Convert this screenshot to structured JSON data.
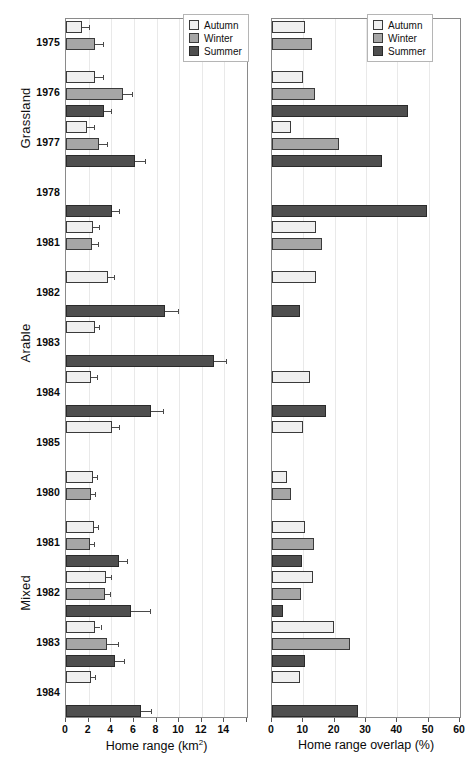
{
  "figure": {
    "title": "",
    "groups": [
      {
        "name": "Grassland",
        "label": "Grassland"
      },
      {
        "name": "Arable",
        "label": "Arable"
      },
      {
        "name": "Mixed",
        "label": "Mixed"
      }
    ],
    "seasons": [
      {
        "key": "autumn",
        "label": "Autumn",
        "color": "#efefef"
      },
      {
        "key": "winter",
        "label": "Winter",
        "color": "#a6a6a6"
      },
      {
        "key": "summer",
        "label": "Summer",
        "color": "#4f4f4f"
      }
    ],
    "legend": {
      "position": "top-right",
      "entries": [
        "Autumn",
        "Winter",
        "Summer"
      ]
    },
    "years": [
      "1975",
      "1976",
      "1977",
      "1978",
      "1981",
      "1982",
      "1983",
      "1984",
      "1985",
      "1980",
      "1981",
      "1982",
      "1983",
      "1984"
    ]
  },
  "chart_data": [
    {
      "type": "bar",
      "panel": "left",
      "title": "",
      "xlabel": "Home range (km2)",
      "xlabel_html": "Home range (km<sup>2</sup>)",
      "ylabel": "",
      "orientation": "horizontal",
      "xlim": [
        0,
        16
      ],
      "xticks": [
        0,
        2,
        4,
        6,
        8,
        10,
        12,
        14,
        16
      ],
      "xticklabels": [
        "0",
        "2",
        "4",
        "6",
        "8",
        "10",
        "12",
        "14",
        ""
      ],
      "grid": "vertical",
      "legend": [
        "Autumn",
        "Winter",
        "Summer"
      ],
      "error_bars": true,
      "groups": [
        {
          "habitat": "Grassland",
          "rows": [
            {
              "year": "1975",
              "bars": [
                {
                  "season": "Autumn",
                  "value": 1.45,
                  "err": 0.55
                },
                {
                  "season": "Winter",
                  "value": 2.55,
                  "err": 0.75
                }
              ]
            },
            {
              "year": "1976",
              "bars": [
                {
                  "season": "Autumn",
                  "value": 2.55,
                  "err": 0.7
                },
                {
                  "season": "Winter",
                  "value": 5.05,
                  "err": 0.8
                },
                {
                  "season": "Summer",
                  "value": 3.4,
                  "err": 0.55
                }
              ]
            },
            {
              "year": "1977",
              "bars": [
                {
                  "season": "Autumn",
                  "value": 1.9,
                  "err": 0.6
                },
                {
                  "season": "Winter",
                  "value": 2.95,
                  "err": 0.7
                },
                {
                  "season": "Summer",
                  "value": 6.1,
                  "err": 0.9
                }
              ]
            },
            {
              "year": "1978",
              "bars": [
                {
                  "season": "Summer",
                  "value": 4.1,
                  "err": 0.6
                }
              ]
            }
          ]
        },
        {
          "habitat": "Arable",
          "rows": [
            {
              "year": "1981",
              "bars": [
                {
                  "season": "Autumn",
                  "value": 2.4,
                  "err": 0.55
                },
                {
                  "season": "Winter",
                  "value": 2.3,
                  "err": 0.55
                }
              ]
            },
            {
              "year": "1982",
              "bars": [
                {
                  "season": "Autumn",
                  "value": 3.7,
                  "err": 0.55
                },
                {
                  "season": "Summer",
                  "value": 8.75,
                  "err": 1.15
                }
              ]
            },
            {
              "year": "1983",
              "bars": [
                {
                  "season": "Autumn",
                  "value": 2.6,
                  "err": 0.35
                },
                {
                  "season": "Summer",
                  "value": 13.1,
                  "err": 1.05
                }
              ]
            },
            {
              "year": "1984",
              "bars": [
                {
                  "season": "Autumn",
                  "value": 2.25,
                  "err": 0.45
                },
                {
                  "season": "Summer",
                  "value": 7.55,
                  "err": 1.05
                }
              ]
            },
            {
              "year": "1985",
              "bars": [
                {
                  "season": "Autumn",
                  "value": 4.1,
                  "err": 0.55
                }
              ]
            }
          ]
        },
        {
          "habitat": "Mixed",
          "rows": [
            {
              "year": "1980",
              "bars": [
                {
                  "season": "Autumn",
                  "value": 2.4,
                  "err": 0.35
                },
                {
                  "season": "Winter",
                  "value": 2.2,
                  "err": 0.4
                }
              ]
            },
            {
              "year": "1981",
              "bars": [
                {
                  "season": "Autumn",
                  "value": 2.45,
                  "err": 0.4
                },
                {
                  "season": "Winter",
                  "value": 2.15,
                  "err": 0.35
                },
                {
                  "season": "Summer",
                  "value": 4.7,
                  "err": 0.7
                }
              ]
            },
            {
              "year": "1982",
              "bars": [
                {
                  "season": "Autumn",
                  "value": 3.55,
                  "err": 0.45
                },
                {
                  "season": "Winter",
                  "value": 3.45,
                  "err": 0.45
                },
                {
                  "season": "Summer",
                  "value": 5.75,
                  "err": 1.7
                }
              ]
            },
            {
              "year": "1983",
              "bars": [
                {
                  "season": "Autumn",
                  "value": 2.6,
                  "err": 0.45
                },
                {
                  "season": "Winter",
                  "value": 3.6,
                  "err": 1.0
                },
                {
                  "season": "Summer",
                  "value": 4.35,
                  "err": 0.8
                }
              ]
            },
            {
              "year": "1984",
              "bars": [
                {
                  "season": "Autumn",
                  "value": 2.2,
                  "err": 0.4
                },
                {
                  "season": "Summer",
                  "value": 6.6,
                  "err": 0.9
                }
              ]
            }
          ]
        }
      ]
    },
    {
      "type": "bar",
      "panel": "right",
      "title": "",
      "xlabel": "Home range overlap (%)",
      "xlabel_html": "Home range overlap (%)",
      "ylabel": "",
      "orientation": "horizontal",
      "xlim": [
        0,
        60
      ],
      "xticks": [
        0,
        10,
        20,
        30,
        40,
        50,
        60
      ],
      "xticklabels": [
        "0",
        "10",
        "20",
        "30",
        "40",
        "50",
        "60"
      ],
      "grid": "vertical",
      "legend": [
        "Autumn",
        "Winter",
        "Summer"
      ],
      "error_bars": false,
      "groups": [
        {
          "habitat": "Grassland",
          "rows": [
            {
              "year": "1975",
              "bars": [
                {
                  "season": "Autumn",
                  "value": 10.5
                },
                {
                  "season": "Winter",
                  "value": 12.8
                }
              ]
            },
            {
              "year": "1976",
              "bars": [
                {
                  "season": "Autumn",
                  "value": 9.8
                },
                {
                  "season": "Winter",
                  "value": 13.6
                },
                {
                  "season": "Summer",
                  "value": 43.5
                }
              ]
            },
            {
              "year": "1977",
              "bars": [
                {
                  "season": "Autumn",
                  "value": 6.0
                },
                {
                  "season": "Winter",
                  "value": 21.5
                },
                {
                  "season": "Summer",
                  "value": 35.0
                }
              ]
            },
            {
              "year": "1978",
              "bars": [
                {
                  "season": "Summer",
                  "value": 49.5
                }
              ]
            }
          ]
        },
        {
          "habitat": "Arable",
          "rows": [
            {
              "year": "1981",
              "bars": [
                {
                  "season": "Autumn",
                  "value": 14.2
                },
                {
                  "season": "Winter",
                  "value": 15.8
                }
              ]
            },
            {
              "year": "1982",
              "bars": [
                {
                  "season": "Autumn",
                  "value": 14.0
                },
                {
                  "season": "Summer",
                  "value": 9.0
                }
              ]
            },
            {
              "year": "1983",
              "bars": []
            },
            {
              "year": "1984",
              "bars": [
                {
                  "season": "Autumn",
                  "value": 12.2
                },
                {
                  "season": "Summer",
                  "value": 17.2
                }
              ]
            },
            {
              "year": "1985",
              "bars": [
                {
                  "season": "Autumn",
                  "value": 10.0
                }
              ]
            }
          ]
        },
        {
          "habitat": "Mixed",
          "rows": [
            {
              "year": "1980",
              "bars": [
                {
                  "season": "Autumn",
                  "value": 4.8
                },
                {
                  "season": "Winter",
                  "value": 6.2
                }
              ]
            },
            {
              "year": "1981",
              "bars": [
                {
                  "season": "Autumn",
                  "value": 10.5
                },
                {
                  "season": "Winter",
                  "value": 13.5
                },
                {
                  "season": "Summer",
                  "value": 9.6
                }
              ]
            },
            {
              "year": "1982",
              "bars": [
                {
                  "season": "Autumn",
                  "value": 13.2
                },
                {
                  "season": "Winter",
                  "value": 9.2
                },
                {
                  "season": "Summer",
                  "value": 3.4
                }
              ]
            },
            {
              "year": "1983",
              "bars": [
                {
                  "season": "Autumn",
                  "value": 19.8
                },
                {
                  "season": "Winter",
                  "value": 24.8
                },
                {
                  "season": "Summer",
                  "value": 10.5
                }
              ]
            },
            {
              "year": "1984",
              "bars": [
                {
                  "season": "Autumn",
                  "value": 9.0
                },
                {
                  "season": "Summer",
                  "value": 27.5
                }
              ]
            }
          ]
        }
      ]
    }
  ]
}
